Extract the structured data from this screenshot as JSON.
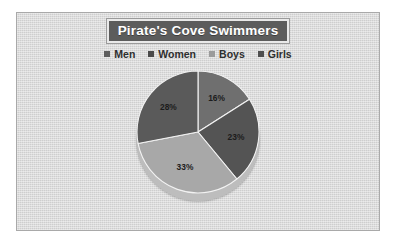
{
  "chart": {
    "title": "Pirate's Cove Swimmers",
    "background_color": "#d5d5d5",
    "frame_border_color": "#a9a9a9",
    "title_background_color": "#5c5c5c",
    "title_text_color": "#ffffff"
  },
  "legend": {
    "position": "top",
    "items": [
      {
        "label": "Men",
        "color": "#6f6f6f",
        "swatch_color": "#5e5e5e"
      },
      {
        "label": "Women",
        "color": "#545454",
        "swatch_color": "#4a4a4a"
      },
      {
        "label": "Boys",
        "color": "#a8a8a8",
        "swatch_color": "#9b9b9b"
      },
      {
        "label": "Girls",
        "color": "#5a5a5a",
        "swatch_color": "#4f4f4f"
      }
    ]
  },
  "chart_data": {
    "type": "pie",
    "title": "Pirate's Cove Swimmers",
    "xlabel": "",
    "ylabel": "",
    "grid": false,
    "legend_position": "top",
    "start_angle_deg": 0,
    "direction": "clockwise",
    "categories": [
      "Men",
      "Women",
      "Boys",
      "Girls"
    ],
    "values": [
      16,
      23,
      33,
      28
    ],
    "value_unit": "%",
    "data_labels": [
      "16%",
      "23%",
      "33%",
      "28%"
    ],
    "colors": [
      "#6f6f6f",
      "#545454",
      "#a8a8a8",
      "#5a5a5a"
    ],
    "total": 100
  }
}
